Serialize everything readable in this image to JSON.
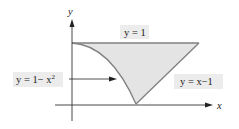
{
  "diagram": {
    "axes": {
      "x_label": "x",
      "y_label": "y"
    },
    "labels": {
      "top_line": "y = 1",
      "parabola_lhs": "y = 1− x",
      "parabola_exp": "2",
      "line": "y = x−1"
    },
    "colors": {
      "fill": "#e4e4e4",
      "stroke": "#808080",
      "axis": "#333333",
      "label_bg": "#ececec"
    },
    "curves": [
      {
        "name": "y = 1",
        "kind": "horizontal line"
      },
      {
        "name": "y = 1 - x^2",
        "kind": "parabola"
      },
      {
        "name": "y = x - 1",
        "kind": "line"
      }
    ],
    "region": "shaded region bounded by y = 1 - x^2, y = 1, and y = x - 1"
  }
}
